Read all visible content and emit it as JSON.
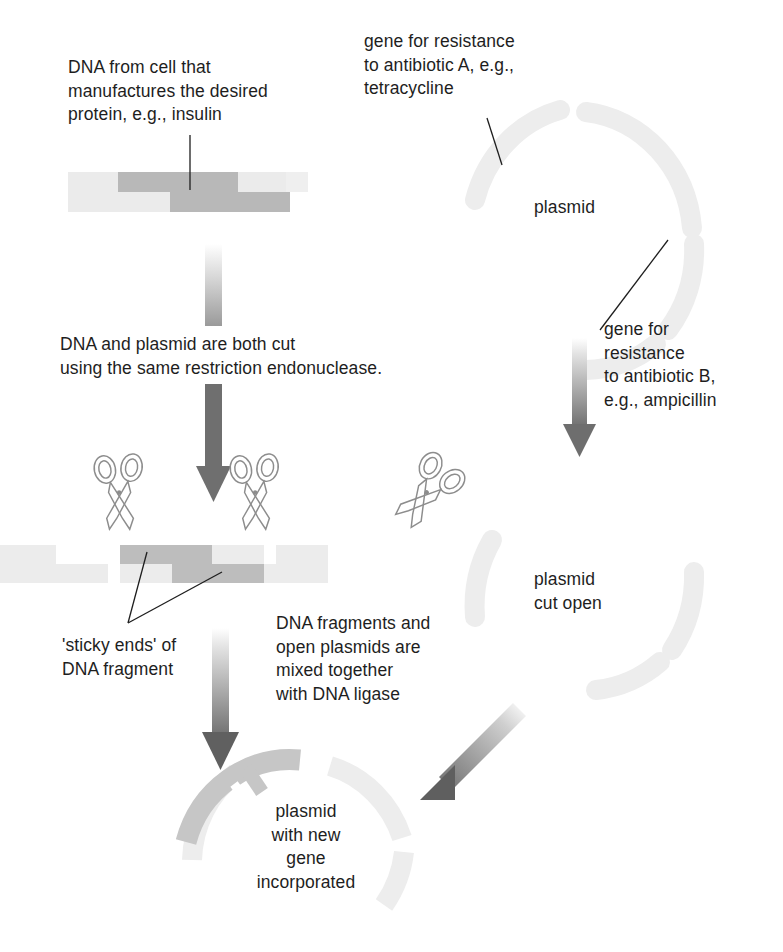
{
  "diagram": {
    "colors": {
      "text": "#1e1e1e",
      "dna_backbone": "#e8e8e8",
      "dna_gene": "#b9b9b9",
      "plasmid_faint": "#ededed",
      "plasmid_ring": "#cfcfcf",
      "inserted_gene": "#bdbdbd",
      "arrow_dark": "#6b6b6b",
      "arrow_light": "#dcdcdc",
      "leader_line": "#1e1e1e",
      "scissors_outline": "#8a8a8a"
    }
  },
  "labels": {
    "dna_source": "DNA from cell that\nmanufactures the desired\nprotein, e.g., insulin",
    "gene_resistance_a": "gene for resistance\nto antibiotic A, e.g.,\ntetracycline",
    "plasmid": "plasmid",
    "gene_resistance_b": "gene for\nresistance\nto antibiotic B,\ne.g., ampicillin",
    "cut_step": "DNA and plasmid are both cut\nusing the same restriction endonuclease.",
    "sticky_ends": "'sticky ends' of\nDNA fragment",
    "mixing_step": "DNA fragments and\nopen plasmids are\nmixed together\nwith DNA ligase",
    "plasmid_cut_open": "plasmid\ncut open",
    "plasmid_with_gene": "plasmid\nwith new\ngene\nincorporated"
  },
  "icons": {
    "scissors_left": "scissors-icon",
    "scissors_right": "scissors-icon",
    "scissors_plasmid": "scissors-icon"
  },
  "elements": {
    "dna_strand_top": "double-stranded DNA with darker gene region",
    "dna_fragments_cut": "cut DNA showing staggered sticky ends",
    "plasmid_ring_top": "circular plasmid",
    "plasmid_ring_open": "linearised / opened plasmid arcs",
    "plasmid_ring_final": "recombinant plasmid with inserted gene"
  },
  "arrows": [
    {
      "name": "arrow-dna-fade",
      "direction": "down",
      "shade": "light"
    },
    {
      "name": "arrow-dna-cut",
      "direction": "down",
      "shade": "dark"
    },
    {
      "name": "arrow-plasmid-cut",
      "direction": "down",
      "shade": "dark"
    },
    {
      "name": "arrow-ligate-left",
      "direction": "down",
      "shade": "dark"
    },
    {
      "name": "arrow-ligate-right",
      "direction": "down-left",
      "shade": "dark"
    }
  ]
}
